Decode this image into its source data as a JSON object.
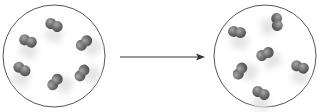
{
  "diagram": {
    "colors": {
      "container_stroke": "#555555",
      "molecule_fill": "#6e6e6e",
      "molecule_highlight": "#9a9a9a",
      "arrow": "#333333",
      "motion_blur": "#e2e2e2"
    },
    "left_container": {
      "cx": 54,
      "cy": 56,
      "r": 51,
      "molecules": [
        {
          "x": 54,
          "y": 25,
          "angle": 25
        },
        {
          "x": 28,
          "y": 41,
          "angle": 20
        },
        {
          "x": 84,
          "y": 43,
          "angle": -40
        },
        {
          "x": 22,
          "y": 69,
          "angle": 30
        },
        {
          "x": 55,
          "y": 82,
          "angle": -50
        },
        {
          "x": 82,
          "y": 73,
          "angle": -55
        }
      ]
    },
    "arrow": {
      "x1": 120,
      "y1": 57,
      "x2": 205,
      "y2": 57
    },
    "right_container": {
      "cx": 265,
      "cy": 56,
      "r": 51,
      "molecules": [
        {
          "x": 237,
          "y": 32,
          "angle": 10
        },
        {
          "x": 277,
          "y": 22,
          "angle": 85
        },
        {
          "x": 265,
          "y": 54,
          "angle": -25
        },
        {
          "x": 240,
          "y": 71,
          "angle": -60
        },
        {
          "x": 300,
          "y": 67,
          "angle": 20
        },
        {
          "x": 261,
          "y": 93,
          "angle": 25
        }
      ]
    }
  }
}
